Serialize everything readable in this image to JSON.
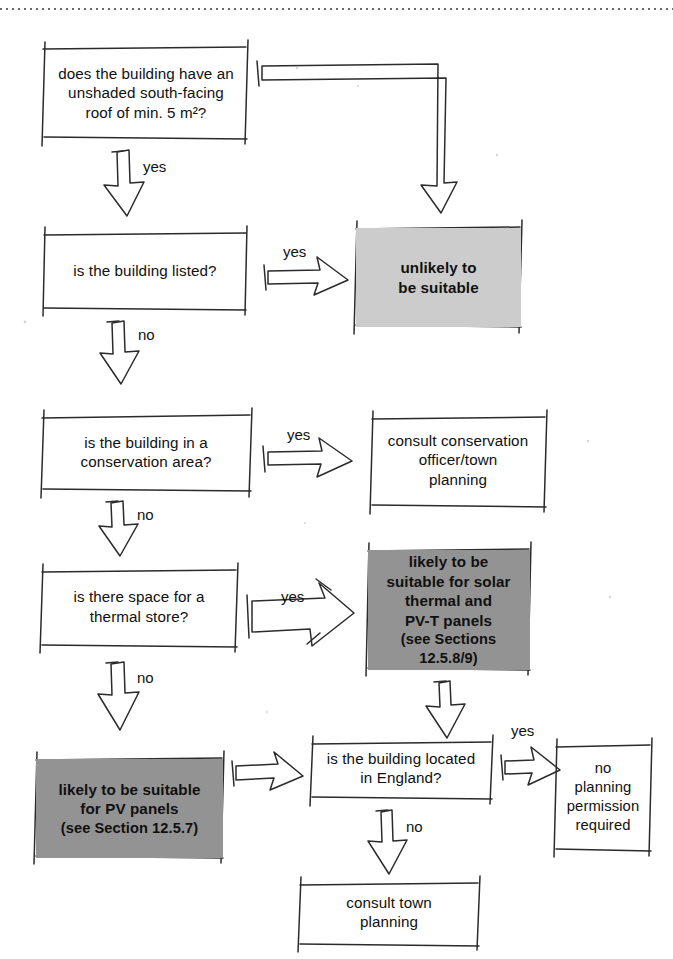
{
  "page": {
    "top_rule": "dotted-rule",
    "colors": {
      "ink": "#1c1c1c",
      "light_fill": "#cccccc",
      "dark_fill": "#939393",
      "paper": "#ffffff"
    }
  },
  "nodes": [
    {
      "id": "q-roof",
      "name": "question-unshaded-roof",
      "text": "does the building have an\nunshaded south-facing\nroof of min. 5 m²?",
      "kind": "question",
      "fill": "none"
    },
    {
      "id": "q-listed",
      "name": "question-building-listed",
      "text": "is the building listed?",
      "kind": "question",
      "fill": "none"
    },
    {
      "id": "r-unlikely",
      "name": "result-unlikely-suitable",
      "text": "unlikely to\nbe suitable",
      "kind": "result",
      "fill": "light"
    },
    {
      "id": "q-conservation",
      "name": "question-conservation-area",
      "text": "is the building in a\nconservation area?",
      "kind": "question",
      "fill": "none"
    },
    {
      "id": "a-consult-conservation",
      "name": "action-consult-conservation-officer",
      "text": "consult conservation\nofficer/town\nplanning",
      "kind": "action",
      "fill": "none"
    },
    {
      "id": "q-thermal-store",
      "name": "question-thermal-store-space",
      "text": "is there space for a\nthermal store?",
      "kind": "question",
      "fill": "none"
    },
    {
      "id": "r-solar-thermal",
      "name": "result-likely-suitable-solar-thermal",
      "text": "likely to be\nsuitable for solar\nthermal and\nPV-T panels",
      "subtext": "(see Sections 12.5.8/9)",
      "kind": "result",
      "fill": "dark"
    },
    {
      "id": "r-pv",
      "name": "result-likely-suitable-pv",
      "text": "likely to be suitable\nfor PV panels",
      "subtext": "(see Section 12.5.7)",
      "kind": "result",
      "fill": "dark"
    },
    {
      "id": "q-england",
      "name": "question-located-in-england",
      "text": "is the building located\nin England?",
      "kind": "question",
      "fill": "none"
    },
    {
      "id": "r-no-permission",
      "name": "result-no-planning-permission",
      "text": "no\nplanning\npermission\nrequired",
      "kind": "result",
      "fill": "none"
    },
    {
      "id": "a-consult-town",
      "name": "action-consult-town-planning",
      "text": "consult town\nplanning",
      "kind": "action",
      "fill": "none"
    }
  ],
  "edge_labels": [
    {
      "id": "e1",
      "name": "edge-label-yes-roof-down",
      "text": "yes"
    },
    {
      "id": "e2",
      "name": "edge-label-yes-listed",
      "text": "yes"
    },
    {
      "id": "e3",
      "name": "edge-label-no-listed",
      "text": "no"
    },
    {
      "id": "e4",
      "name": "edge-label-yes-conservation",
      "text": "yes"
    },
    {
      "id": "e5",
      "name": "edge-label-no-conservation",
      "text": "no"
    },
    {
      "id": "e6",
      "name": "edge-label-yes-thermal-store",
      "text": "yes"
    },
    {
      "id": "e7",
      "name": "edge-label-no-thermal-store",
      "text": "no"
    },
    {
      "id": "e8",
      "name": "edge-label-yes-england",
      "text": "yes"
    },
    {
      "id": "e9",
      "name": "edge-label-no-england",
      "text": "no"
    }
  ]
}
